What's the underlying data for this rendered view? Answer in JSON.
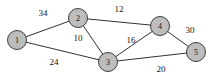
{
  "figure": {
    "width": 218,
    "height": 78,
    "background_color": "#ffffff",
    "node_fill_color": "#bdbdbd",
    "node_stroke_color": "#2b2b2b",
    "edge_color": "#1a1a1a",
    "label_color": "#111111"
  },
  "chart_data": {
    "type": "diagram",
    "graph_type": "weighted-undirected-graph",
    "title": "",
    "nodes": [
      {
        "id": "1",
        "label": "1",
        "x": 17,
        "y": 40,
        "r": 9.5
      },
      {
        "id": "2",
        "label": "2",
        "x": 78,
        "y": 18,
        "r": 9.5
      },
      {
        "id": "3",
        "label": "3",
        "x": 108,
        "y": 62,
        "r": 9.5
      },
      {
        "id": "4",
        "label": "4",
        "x": 160,
        "y": 26,
        "r": 9.5
      },
      {
        "id": "5",
        "label": "5",
        "x": 196,
        "y": 52,
        "r": 9.5
      }
    ],
    "edges": [
      {
        "source": "1",
        "target": "2",
        "weight": 34,
        "label": "34",
        "lx": 43,
        "ly": 13
      },
      {
        "source": "1",
        "target": "3",
        "weight": 24,
        "label": "24",
        "lx": 54,
        "ly": 62
      },
      {
        "source": "2",
        "target": "3",
        "weight": 10,
        "label": "10",
        "lx": 78,
        "ly": 38
      },
      {
        "source": "2",
        "target": "4",
        "weight": 12,
        "label": "12",
        "lx": 119,
        "ly": 9
      },
      {
        "source": "3",
        "target": "4",
        "weight": 16,
        "label": "16",
        "lx": 131,
        "ly": 40
      },
      {
        "source": "3",
        "target": "5",
        "weight": 20,
        "label": "20",
        "lx": 161,
        "ly": 69
      },
      {
        "source": "4",
        "target": "5",
        "weight": 30,
        "label": "30",
        "lx": 190,
        "ly": 30
      }
    ],
    "node_count": 5,
    "edge_count": 7
  }
}
